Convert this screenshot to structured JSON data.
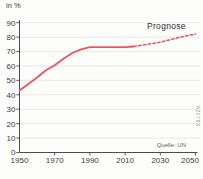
{
  "figure": {
    "background": "#fdfdfc"
  },
  "chart_data": {
    "type": "line",
    "title": "",
    "ylabel": "in %",
    "xlabel": "",
    "annotation": "Prognose",
    "source": "Quelle: UN",
    "figure_code": "62078X",
    "ylim": [
      0,
      90
    ],
    "yticks": [
      0,
      10,
      20,
      30,
      40,
      50,
      60,
      70,
      80,
      90
    ],
    "xlim": [
      1950,
      2050
    ],
    "xticks": [
      1950,
      1970,
      1990,
      2010,
      2030,
      2050
    ],
    "grid": "horizontal",
    "legend_position": "none",
    "colors": {
      "line": "#e7575f",
      "grid": "#e0e0e0",
      "axis": "#4c4c4c",
      "tick_text": "#3c3c3c"
    },
    "series": [
      {
        "name": "historical",
        "style": "solid",
        "x": [
          1950,
          1955,
          1960,
          1965,
          1970,
          1975,
          1980,
          1985,
          1990,
          1995,
          2000,
          2005,
          2010,
          2015
        ],
        "values": [
          43,
          47.5,
          52,
          57,
          60.5,
          65,
          69,
          71.5,
          73,
          73,
          73,
          73,
          73,
          73.5
        ]
      },
      {
        "name": "Prognose",
        "style": "dashed",
        "x": [
          2015,
          2020,
          2025,
          2030,
          2035,
          2040,
          2045,
          2050
        ],
        "values": [
          73.5,
          74.5,
          75.5,
          76.5,
          78,
          79.5,
          81,
          82
        ]
      }
    ]
  }
}
